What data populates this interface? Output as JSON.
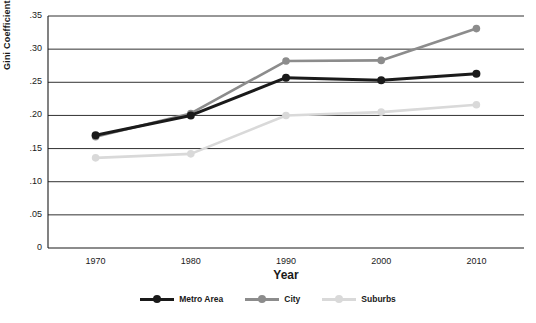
{
  "chart_data": {
    "type": "line",
    "title": "",
    "xlabel": "Year",
    "ylabel": "Gini Coefficient",
    "categories": [
      "1970",
      "1980",
      "1990",
      "2000",
      "2010"
    ],
    "x": [
      1970,
      1980,
      1990,
      2000,
      2010
    ],
    "xlim": [
      1965,
      2015
    ],
    "ylim": [
      0,
      0.35
    ],
    "yticks": [
      "0",
      ".05",
      ".10",
      ".15",
      ".20",
      ".25",
      ".30",
      ".35"
    ],
    "ytick_values": [
      0,
      0.05,
      0.1,
      0.15,
      0.2,
      0.25,
      0.3,
      0.35
    ],
    "grid": "horizontal",
    "legend_position": "bottom",
    "series": [
      {
        "name": "Metro Area",
        "color": "#1a1a1a",
        "values": [
          0.17,
          0.2,
          0.257,
          0.253,
          0.263
        ]
      },
      {
        "name": "City",
        "color": "#8c8c8c",
        "values": [
          0.168,
          0.203,
          0.282,
          0.283,
          0.331
        ]
      },
      {
        "name": "Suburbs",
        "color": "#d9d9d9",
        "values": [
          0.136,
          0.142,
          0.2,
          0.205,
          0.216
        ]
      }
    ]
  }
}
